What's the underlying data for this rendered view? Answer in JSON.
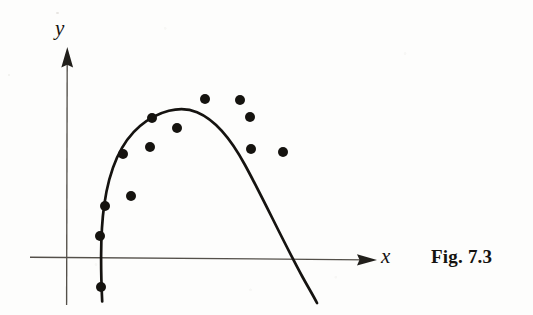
{
  "figure": {
    "caption": "Fig. 7.3",
    "x_axis_label": "x",
    "y_axis_label": "y"
  },
  "colors": {
    "ink": "#15130f",
    "axis": "#4b4741",
    "page": "#fdfdfc"
  },
  "chart_data": {
    "type": "scatter",
    "title": "",
    "subtitle": "",
    "xlabel": "x",
    "ylabel": "y",
    "grid": false,
    "legend": "none",
    "annotations": [
      "Fig. 7.3"
    ],
    "axes": {
      "origin_px": [
        67,
        259
      ],
      "x_axis_px": {
        "x1": 30,
        "y1": 257,
        "x2": 373,
        "y2": 260,
        "arrow": "right"
      },
      "y_axis_px": {
        "x1": 67,
        "y1": 305,
        "x2": 67,
        "y2": 48,
        "arrow": "up"
      },
      "xlim_px": [
        30,
        373
      ],
      "ylim_px": [
        305,
        48
      ],
      "ticks": [],
      "tick_labels": []
    },
    "series": [
      {
        "name": "data points",
        "marker": "filled-circle",
        "marker_radius_px": 5,
        "points_px": [
          [
            101,
            287
          ],
          [
            100,
            236
          ],
          [
            105,
            206
          ],
          [
            131,
            196
          ],
          [
            123,
            154
          ],
          [
            150,
            147
          ],
          [
            152,
            118
          ],
          [
            177,
            128
          ],
          [
            205,
            99
          ],
          [
            240,
            100
          ],
          [
            250,
            117
          ],
          [
            251,
            149
          ],
          [
            283,
            152
          ]
        ]
      },
      {
        "name": "fitted parabola",
        "type": "curve",
        "style": "solid",
        "stroke_width_px": 2.6,
        "vertex_px": [
          197,
          112
        ],
        "x_intercepts_px": [
          100,
          312
        ],
        "endpoints_px": [
          [
            102,
            301
          ],
          [
            317,
            303
          ]
        ]
      }
    ]
  }
}
